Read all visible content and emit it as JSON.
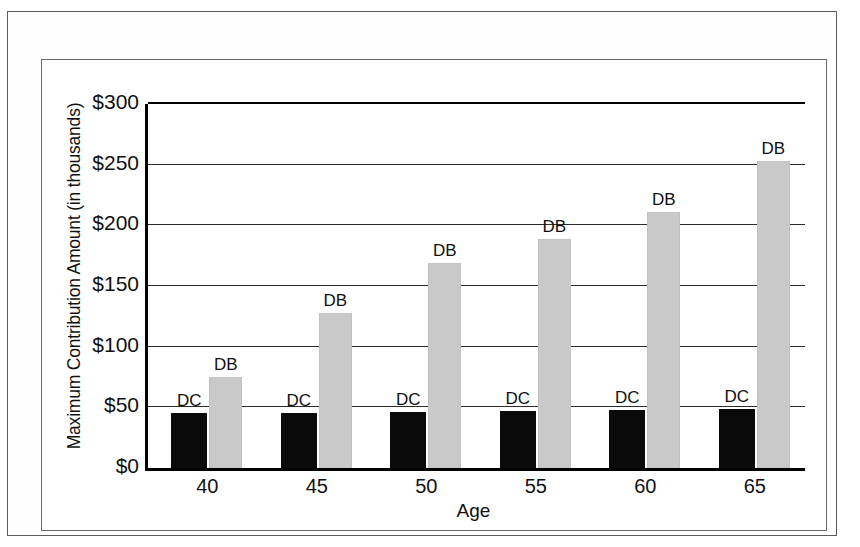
{
  "chart_data": {
    "type": "bar",
    "title": "",
    "xlabel": "Age",
    "ylabel": "Maximum Contribution Amount (in thousands)",
    "categories": [
      "40",
      "45",
      "50",
      "55",
      "60",
      "65"
    ],
    "ylim": [
      0,
      300
    ],
    "ytick_labels": [
      "$300",
      "$250",
      "$200",
      "$150",
      "$100",
      "$50",
      "$0"
    ],
    "ytick_values": [
      300,
      250,
      200,
      150,
      100,
      50,
      0
    ],
    "grid": true,
    "legend_position": "data-labels-above-bars",
    "series": [
      {
        "name": "DC",
        "label": "DC",
        "color": "#0a0a0a",
        "values": [
          45,
          45,
          46,
          47,
          48,
          49
        ]
      },
      {
        "name": "DB",
        "label": "DB",
        "color": "#c9c9c9",
        "values": [
          75,
          128,
          169,
          189,
          211,
          253
        ]
      }
    ],
    "bar_labels": [
      [
        "DC",
        "DB"
      ],
      [
        "DC",
        "DB"
      ],
      [
        "DC",
        "DB"
      ],
      [
        "DC",
        "DB"
      ],
      [
        "DC",
        "DB"
      ],
      [
        "DC",
        "DB"
      ]
    ]
  }
}
